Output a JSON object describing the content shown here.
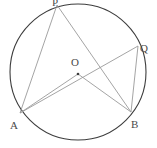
{
  "figure": {
    "type": "circle-geometry-diagram",
    "canvas": {
      "width": 157,
      "height": 148
    },
    "stroke_color_circle": "#3d3d3d",
    "stroke_color_chords": "#9a9a9a",
    "label_color": "#4a4a4a",
    "background": "#ffffff"
  },
  "circle": {
    "center_label": "O",
    "center": {
      "x": 78,
      "y": 72
    },
    "radius": 68
  },
  "points": [
    {
      "id": "P",
      "label": "P",
      "x": 57,
      "y": 5,
      "label_x": 52,
      "label_y": -2
    },
    {
      "id": "Q",
      "label": "Q",
      "x": 138,
      "y": 46,
      "label_x": 140,
      "label_y": 44
    },
    {
      "id": "A",
      "label": "A",
      "x": 20,
      "y": 113,
      "label_x": 10,
      "label_y": 121
    },
    {
      "id": "B",
      "label": "B",
      "x": 131,
      "y": 112,
      "label_x": 131,
      "label_y": 120
    },
    {
      "id": "O",
      "label": "O",
      "x": 78,
      "y": 72,
      "label_x": 71,
      "label_y": 58
    }
  ],
  "segments": [
    {
      "name": "PA",
      "from": "P",
      "to": "A"
    },
    {
      "name": "PB",
      "from": "P",
      "to": "B"
    },
    {
      "name": "QA",
      "from": "Q",
      "to": "A"
    },
    {
      "name": "QB",
      "from": "Q",
      "to": "B"
    },
    {
      "name": "OA",
      "from": "O",
      "to": "A"
    },
    {
      "name": "OB",
      "from": "O",
      "to": "B"
    }
  ],
  "center_dot": {
    "x": 78,
    "y": 74,
    "r": 1.2
  }
}
